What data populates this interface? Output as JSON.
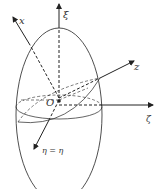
{
  "diagram": {
    "colors": {
      "stroke": "#222222",
      "label": "#333333",
      "background": "#ffffff"
    },
    "labels": {
      "x_axis": "x",
      "xi_axis": "ξ",
      "z_axis": "z",
      "zeta_axis": "ζ",
      "eta_axis": "η = η",
      "origin": "O"
    }
  }
}
